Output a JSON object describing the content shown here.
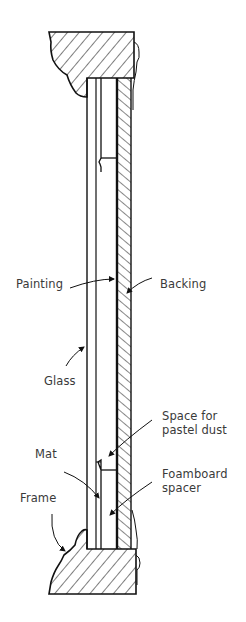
{
  "diagram": {
    "colors": {
      "line": "#111111",
      "text": "#3a3a3a",
      "background": "#ffffff"
    },
    "labels": {
      "painting": "Painting",
      "backing": "Backing",
      "glass": "Glass",
      "space_line1": "Space for",
      "space_line2": "pastel dust",
      "mat": "Mat",
      "foamboard_line1": "Foamboard",
      "foamboard_line2": "spacer",
      "frame": "Frame"
    }
  }
}
